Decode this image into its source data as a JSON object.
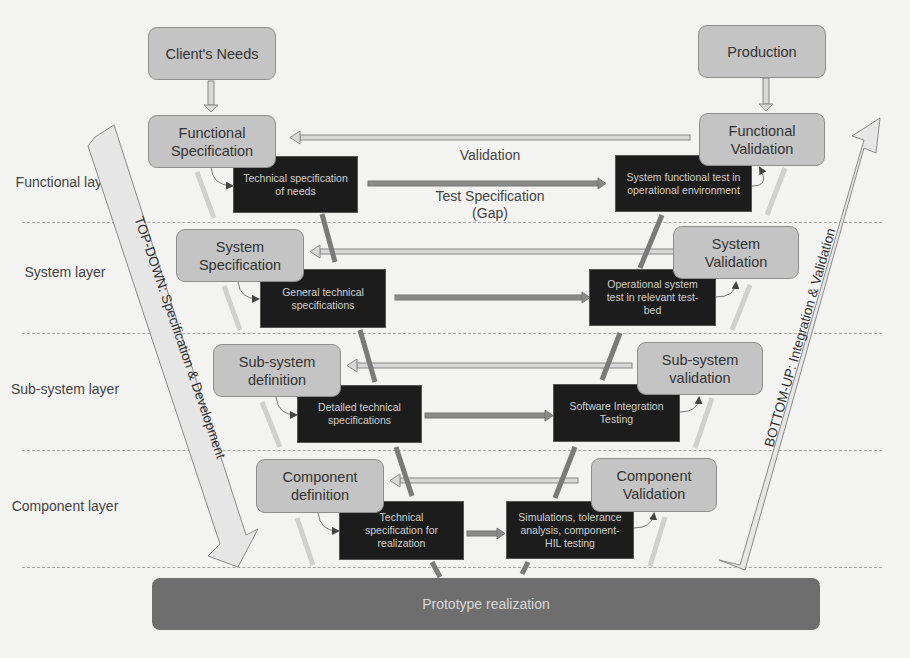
{
  "layers": [
    {
      "label": "Functional layer"
    },
    {
      "label": "System layer"
    },
    {
      "label": "Sub-system layer"
    },
    {
      "label": "Component layer"
    }
  ],
  "top_nodes": {
    "client_needs": "Client's Needs",
    "production": "Production"
  },
  "left_stages": [
    {
      "label": "Functional Specification"
    },
    {
      "label": "System Specification"
    },
    {
      "label": "Sub-system definition"
    },
    {
      "label": "Component definition"
    }
  ],
  "right_stages": [
    {
      "label": "Functional Validation"
    },
    {
      "label": "System Validation"
    },
    {
      "label": "Sub-system validation"
    },
    {
      "label": "Component Validation"
    }
  ],
  "left_tech": [
    {
      "label": "Technical specification of needs"
    },
    {
      "label": "General technical specifications"
    },
    {
      "label": "Detailed technical specifications"
    },
    {
      "label": "Technical specification for realization"
    }
  ],
  "right_tech": [
    {
      "label": "System functional test in operational environment"
    },
    {
      "label": "Operational system test in relevant test-bed"
    },
    {
      "label": "Software Integration Testing"
    },
    {
      "label": "Simulations, tolerance analysis, component-HIL testing"
    }
  ],
  "captions": {
    "validation": "Validation",
    "test_specification": "Test Specification",
    "gap": "(Gap)"
  },
  "big_arrows": {
    "top_down": "TOP-DOWN: Specification & Development",
    "bottom_up": "BOTTOM-UP: Integration & Validation"
  },
  "base": {
    "prototype": "Prototype realization"
  },
  "colors": {
    "stage_fill": "#c4c4c4",
    "tech_fill": "#1c1c1c",
    "proto_fill": "#6e6e6e",
    "arrow_dark": "#7a7a7a",
    "arrow_light": "#d8d8d8"
  }
}
